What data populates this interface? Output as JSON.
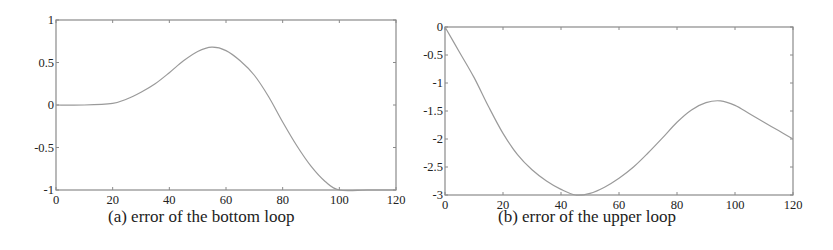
{
  "chart_data": [
    {
      "type": "line",
      "title": "",
      "caption": "(a) error of the bottom loop",
      "xlabel": "",
      "ylabel": "",
      "xlim": [
        0,
        120
      ],
      "ylim": [
        -1,
        1
      ],
      "xticks": [
        0,
        20,
        40,
        60,
        80,
        100,
        120
      ],
      "yticks": [
        -1,
        -0.5,
        0,
        0.5,
        1
      ],
      "xtick_labels": [
        "0",
        "20",
        "40",
        "60",
        "80",
        "100",
        "120"
      ],
      "ytick_labels": [
        "-1",
        "-0.5",
        "0",
        "0.5",
        "1"
      ],
      "grid": false,
      "legend": null,
      "line_color": "#9a9a9a",
      "series": [
        {
          "name": "error",
          "x": [
            0,
            10,
            20,
            25,
            30,
            35,
            40,
            45,
            50,
            55,
            60,
            65,
            70,
            75,
            80,
            85,
            90,
            95,
            100,
            110,
            120
          ],
          "y": [
            0,
            0,
            0.02,
            0.07,
            0.15,
            0.25,
            0.38,
            0.52,
            0.63,
            0.68,
            0.64,
            0.52,
            0.35,
            0.1,
            -0.2,
            -0.48,
            -0.72,
            -0.9,
            -1,
            -1,
            -1
          ]
        }
      ]
    },
    {
      "type": "line",
      "title": "",
      "caption": "(b) error of the upper loop",
      "xlabel": "",
      "ylabel": "",
      "xlim": [
        0,
        120
      ],
      "ylim": [
        -3,
        0
      ],
      "xticks": [
        0,
        20,
        40,
        60,
        80,
        100,
        120
      ],
      "yticks": [
        -3,
        -2.5,
        -2,
        -1.5,
        -1,
        -0.5,
        0
      ],
      "xtick_labels": [
        "0",
        "20",
        "40",
        "60",
        "80",
        "100",
        "120"
      ],
      "ytick_labels": [
        "-3",
        "-2.5",
        "-2",
        "-1.5",
        "-1",
        "-0.5",
        "0"
      ],
      "grid": false,
      "legend": null,
      "line_color": "#9a9a9a",
      "series": [
        {
          "name": "error",
          "x": [
            0,
            5,
            10,
            15,
            20,
            25,
            30,
            35,
            40,
            45,
            50,
            55,
            60,
            65,
            70,
            75,
            80,
            85,
            90,
            95,
            100,
            105,
            110,
            115,
            120
          ],
          "y": [
            0,
            -0.45,
            -0.9,
            -1.42,
            -1.9,
            -2.28,
            -2.55,
            -2.75,
            -2.9,
            -3,
            -2.97,
            -2.86,
            -2.7,
            -2.5,
            -2.25,
            -1.98,
            -1.7,
            -1.48,
            -1.35,
            -1.32,
            -1.4,
            -1.55,
            -1.7,
            -1.85,
            -2
          ]
        }
      ]
    }
  ],
  "captions": {
    "a": "(a) error of the bottom loop",
    "b": "(b) error of the upper loop"
  }
}
